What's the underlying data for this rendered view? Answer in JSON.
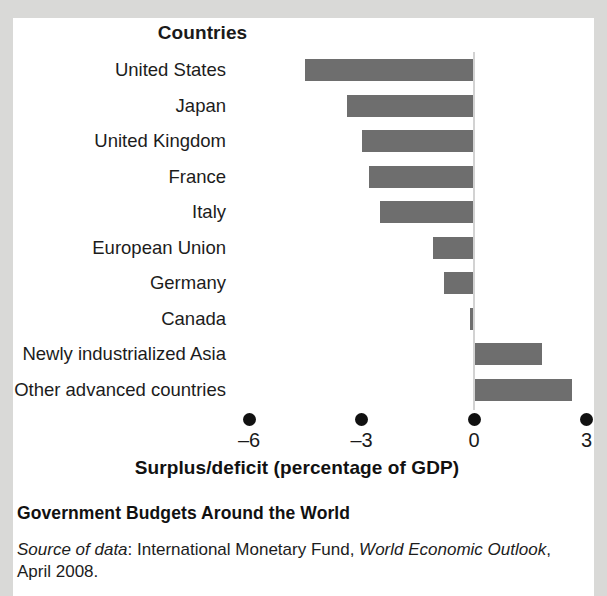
{
  "chart_data": {
    "type": "bar",
    "orientation": "horizontal",
    "title": "Government Budgets Around the World",
    "column_header": "Countries",
    "xlabel": "Surplus/deficit (percentage of GDP)",
    "ylabel": "",
    "xlim": [
      -6.6,
      3.3
    ],
    "xticks": [
      -6,
      -3,
      0,
      3
    ],
    "xtick_labels": [
      "–6",
      "–3",
      "0",
      "3"
    ],
    "grid": false,
    "legend": false,
    "zero_line": true,
    "bar_color": "#6e6e6e",
    "categories": [
      "United States",
      "Japan",
      "United Kingdom",
      "France",
      "Italy",
      "European Union",
      "Germany",
      "Canada",
      "Newly industrialized Asia",
      "Other advanced countries"
    ],
    "values": [
      -4.5,
      -3.4,
      -3.0,
      -2.8,
      -2.5,
      -1.1,
      -0.8,
      -0.1,
      1.8,
      2.6
    ]
  },
  "caption": {
    "title": "Government Budgets Around the World",
    "source_label": "Source of data",
    "source_separator": ": ",
    "source_org": "International Monetary Fund, ",
    "source_publication": "World Economic Outlook",
    "source_date": ", April 2008."
  }
}
